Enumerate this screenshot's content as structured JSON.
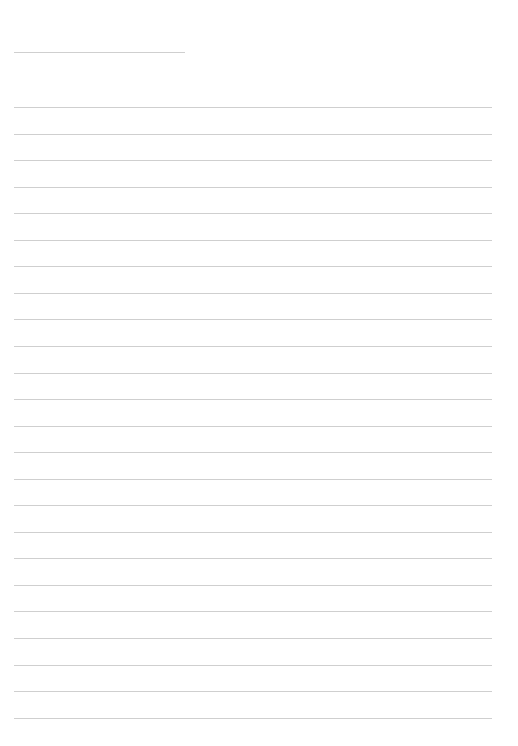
{
  "page": {
    "type": "lined-paper",
    "background": "#ffffff",
    "line_color": "#cfcfcf",
    "header_line": {
      "top": 52,
      "width": 171
    },
    "ruled_lines": {
      "count": 24,
      "first_top": 107,
      "spacing": 26.55
    }
  }
}
